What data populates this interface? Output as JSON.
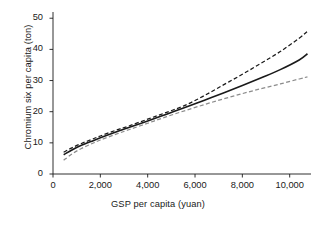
{
  "chart_data": {
    "type": "line",
    "title": "",
    "xlabel": "GSP per capita (yuan)",
    "ylabel": "Chromium six per capita (ton)",
    "xlim": [
      0,
      10900
    ],
    "ylim": [
      0,
      52
    ],
    "xticks": [
      0,
      2000,
      4000,
      6000,
      8000,
      10000
    ],
    "xtick_labels": [
      "0",
      "2,000",
      "4,000",
      "6,000",
      "8,000",
      "10,000"
    ],
    "yticks": [
      0,
      10,
      20,
      30,
      40,
      50
    ],
    "ytick_labels": [
      "0",
      "10",
      "20",
      "30",
      "40",
      "50"
    ],
    "grid": false,
    "legend": "none",
    "series": [
      {
        "name": "upper-confidence-bound",
        "style": "dashed",
        "color": "#1a1a1a",
        "x": [
          450,
          800,
          1200,
          1600,
          2000,
          2600,
          3200,
          4000,
          4800,
          5600,
          6400,
          7200,
          8000,
          8800,
          9600,
          10400,
          10750
        ],
        "y": [
          7.0,
          8.4,
          9.8,
          11.0,
          12.2,
          13.9,
          15.4,
          17.6,
          19.8,
          22.1,
          25.2,
          28.6,
          32.0,
          35.6,
          39.3,
          43.6,
          45.8
        ]
      },
      {
        "name": "fitted-line",
        "style": "solid",
        "color": "#1a1a1a",
        "x": [
          450,
          800,
          1200,
          1600,
          2000,
          2600,
          3200,
          4000,
          4800,
          5600,
          6400,
          7200,
          8000,
          8800,
          9600,
          10400,
          10750
        ],
        "y": [
          6.2,
          7.7,
          9.2,
          10.4,
          11.6,
          13.3,
          14.9,
          17.0,
          19.2,
          21.4,
          23.7,
          26.0,
          28.4,
          30.9,
          33.5,
          36.6,
          38.6
        ]
      },
      {
        "name": "lower-confidence-bound",
        "style": "dashed",
        "color": "#8c8c8c",
        "x": [
          450,
          800,
          1200,
          1600,
          2000,
          2600,
          3200,
          4000,
          4800,
          5600,
          6400,
          7200,
          8000,
          8800,
          9600,
          10400,
          10750
        ],
        "y": [
          4.4,
          6.4,
          8.2,
          9.6,
          10.9,
          12.6,
          14.2,
          16.3,
          18.4,
          20.4,
          22.3,
          24.1,
          25.8,
          27.4,
          28.9,
          30.5,
          31.2
        ]
      }
    ]
  }
}
